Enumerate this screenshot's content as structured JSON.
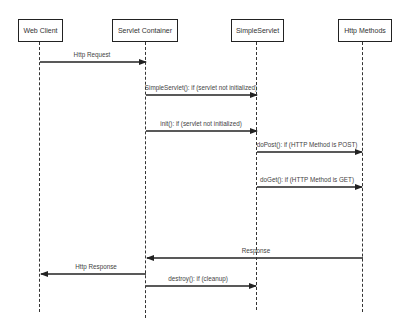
{
  "diagram": {
    "type": "sequence",
    "participants": [
      {
        "id": "web_client",
        "label": "Web Client",
        "box": {
          "x": 18,
          "y": 19,
          "w": 45,
          "h": 23
        },
        "lifeline_x": 40,
        "lifeline_end": 312
      },
      {
        "id": "servlet_container",
        "label": "Servlet Container",
        "box": {
          "x": 112,
          "y": 19,
          "w": 66,
          "h": 23
        },
        "lifeline_x": 146,
        "lifeline_end": 318
      },
      {
        "id": "simple_servlet",
        "label": "SimpleServlet",
        "box": {
          "x": 231,
          "y": 19,
          "w": 53,
          "h": 23
        },
        "lifeline_x": 257,
        "lifeline_end": 310
      },
      {
        "id": "http_methods",
        "label": "Http Methods",
        "box": {
          "x": 338,
          "y": 19,
          "w": 54,
          "h": 23
        },
        "lifeline_x": 363,
        "lifeline_end": 312
      }
    ],
    "messages": [
      {
        "label": "Http Request",
        "from": 40,
        "to": 146,
        "y": 62,
        "label_x": 92,
        "label_y": 51
      },
      {
        "label": "SimpleServlet(): if (servlet not initialized)",
        "from": 146,
        "to": 257,
        "y": 95,
        "label_x": 201,
        "label_y": 84
      },
      {
        "label": "init(): if (servlet not initialized)",
        "from": 146,
        "to": 257,
        "y": 131,
        "label_x": 201,
        "label_y": 120
      },
      {
        "label": "doPost(): if (HTTP Method is POST)",
        "from": 257,
        "to": 362,
        "y": 152,
        "label_x": 307,
        "label_y": 141
      },
      {
        "label": "doGet(): if (HTTP Method is GET)",
        "from": 257,
        "to": 362,
        "y": 187,
        "label_x": 307,
        "label_y": 176
      },
      {
        "label": "Response",
        "from": 363,
        "to": 147,
        "y": 258,
        "label_x": 256,
        "label_y": 247
      },
      {
        "label": "Http Response",
        "from": 146,
        "to": 41,
        "y": 274,
        "label_x": 96,
        "label_y": 263
      },
      {
        "label": "destroy(): if (cleanup)",
        "from": 146,
        "to": 256,
        "y": 286,
        "label_x": 198,
        "label_y": 275
      }
    ]
  }
}
